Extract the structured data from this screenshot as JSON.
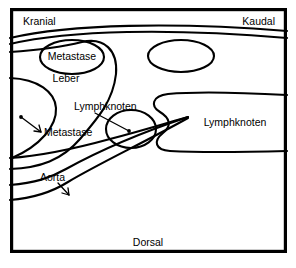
{
  "figure": {
    "type": "anatomical-schematic",
    "language": "de",
    "background_color": "#ffffff",
    "line_color": "#000000",
    "frame": {
      "x": 10,
      "y": 8,
      "width": 277,
      "height": 245
    }
  },
  "orientation_labels": {
    "cranial": {
      "text": "Kranial",
      "x": 23,
      "y": 22
    },
    "caudal": {
      "text": "Kaudal",
      "x": 247,
      "y": 22
    },
    "dorsal": {
      "text": "Dorsal",
      "x": 148,
      "y": 243
    }
  },
  "annotations": [
    {
      "id": "metastase-liver-top",
      "text": "Metastase",
      "x": 72,
      "y": 57,
      "anchor": "middle",
      "has_leader": false
    },
    {
      "id": "leber",
      "text": "Leber",
      "x": 66,
      "y": 79,
      "anchor": "middle",
      "has_leader": false
    },
    {
      "id": "metastase-liver-left",
      "text": "Metastase",
      "x": 44,
      "y": 133,
      "anchor": "start",
      "has_leader": true,
      "leader": {
        "x1": 41,
        "y1": 132,
        "x2": 21,
        "y2": 117
      },
      "dot": {
        "cx": 21,
        "cy": 117,
        "r": 1.9
      }
    },
    {
      "id": "lymphknoten-center",
      "text": "Lymphknoten",
      "x": 74,
      "y": 107,
      "anchor": "start",
      "has_leader": true,
      "leader": {
        "x1": 95,
        "y1": 113,
        "x2": 129,
        "y2": 131
      },
      "dot": {
        "cx": 129,
        "cy": 131,
        "r": 1.9
      }
    },
    {
      "id": "lymphknoten-right",
      "text": "Lymphknoten",
      "x": 235,
      "y": 123,
      "anchor": "middle",
      "has_leader": false
    },
    {
      "id": "aorta",
      "text": "Aorta",
      "x": 40,
      "y": 178,
      "anchor": "start",
      "has_leader": true,
      "leader": {
        "x1": 58,
        "y1": 183,
        "x2": 69,
        "y2": 195
      },
      "dot": null
    }
  ],
  "shapes": {
    "top_band_curve": "M 10,44 C 70,30 170,28 287,38",
    "liver_upper_curve": "M 10,38 C 70,24 175,22 287,31",
    "liver_body": "M 10,52 C 40,50 62,47 82,42 C 104,37 118,50 116,74 C 113,101 98,118 80,139 C 62,160 40,168 10,169",
    "liver_left_lobe": "M 10,78 C 38,79 55,92 56,108 C 57,126 40,146 12,158",
    "metastase_ellipse_top": {
      "cx": 72,
      "cy": 57,
      "rx": 32,
      "ry": 17
    },
    "oval_top_right": {
      "cx": 181,
      "cy": 56,
      "rx": 33,
      "ry": 16
    },
    "lymphknoten_ellipse_center": {
      "cx": 131,
      "cy": 129,
      "rx": 25,
      "ry": 19
    },
    "lymphknoten_right_region": "M 287,95 C 250,93 200,91 168,94 C 152,96 150,106 160,112 C 170,118 172,126 163,133 C 153,141 155,150 170,151 C 205,153 250,152 287,151",
    "aorta_upper_edge": "M 10,158 C 40,156 70,150 110,139 C 145,130 170,122 188,117",
    "aorta_lower_edge": "M 10,185 C 35,183 50,178 66,169 C 95,153 140,133 188,117",
    "aorta_lower_band": "M 10,200 C 35,198 52,192 68,182 C 100,163 145,142 188,118"
  }
}
